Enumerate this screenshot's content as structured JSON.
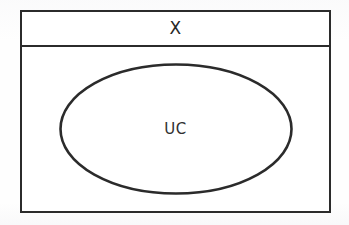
{
  "diagram": {
    "type": "venn-set-diagram",
    "universe": {
      "label": "X",
      "shape": "rectangle"
    },
    "subset": {
      "label": "UC",
      "shape": "ellipse"
    },
    "colors": {
      "stroke": "#2b2b2b",
      "fill": "#ffffff",
      "text": "#262626",
      "background": "#fefefe"
    }
  }
}
